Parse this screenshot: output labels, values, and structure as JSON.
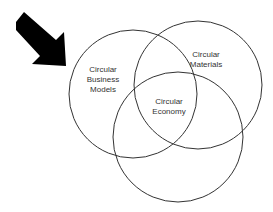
{
  "diagram": {
    "type": "venn",
    "circles": [
      {
        "id": "business",
        "lines": [
          "Circular",
          "Business",
          "Models"
        ],
        "cx": 133,
        "cy": 94,
        "r": 64
      },
      {
        "id": "materials",
        "lines": [
          "Circular",
          "Materials"
        ],
        "cx": 198,
        "cy": 85,
        "r": 64
      },
      {
        "id": "economy",
        "lines": [
          "Circular",
          "Economy"
        ],
        "cx": 178,
        "cy": 137,
        "r": 65
      }
    ],
    "arrow": {
      "icon": "arrow-down-right-icon",
      "color": "#000000",
      "points_to": "business"
    },
    "stroke_color": "#333333"
  }
}
